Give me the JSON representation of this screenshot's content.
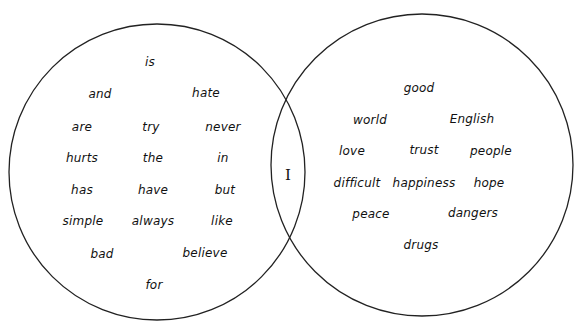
{
  "diagram": {
    "type": "venn",
    "circles": [
      {
        "id": "left",
        "cx": 157,
        "cy": 172,
        "r": 148
      },
      {
        "id": "right",
        "cx": 422,
        "cy": 165,
        "r": 151
      }
    ],
    "intersection": {
      "label": "I",
      "x": 288,
      "y": 175
    }
  },
  "left_words": [
    {
      "text": "is",
      "x": 150,
      "y": 62
    },
    {
      "text": "and",
      "x": 100,
      "y": 94
    },
    {
      "text": "hate",
      "x": 206,
      "y": 93
    },
    {
      "text": "are",
      "x": 82,
      "y": 127
    },
    {
      "text": "try",
      "x": 151,
      "y": 127
    },
    {
      "text": "never",
      "x": 223,
      "y": 127
    },
    {
      "text": "hurts",
      "x": 82,
      "y": 158
    },
    {
      "text": "the",
      "x": 153,
      "y": 158
    },
    {
      "text": "in",
      "x": 223,
      "y": 158
    },
    {
      "text": "has",
      "x": 82,
      "y": 190
    },
    {
      "text": "have",
      "x": 153,
      "y": 190
    },
    {
      "text": "but",
      "x": 225,
      "y": 190
    },
    {
      "text": "simple",
      "x": 83,
      "y": 221
    },
    {
      "text": "always",
      "x": 153,
      "y": 221
    },
    {
      "text": "like",
      "x": 222,
      "y": 221
    },
    {
      "text": "bad",
      "x": 102,
      "y": 254
    },
    {
      "text": "believe",
      "x": 205,
      "y": 253
    },
    {
      "text": "for",
      "x": 154,
      "y": 285
    }
  ],
  "right_words": [
    {
      "text": "good",
      "x": 419,
      "y": 88
    },
    {
      "text": "world",
      "x": 370,
      "y": 120
    },
    {
      "text": "English",
      "x": 472,
      "y": 119
    },
    {
      "text": "love",
      "x": 352,
      "y": 151
    },
    {
      "text": "trust",
      "x": 424,
      "y": 150
    },
    {
      "text": "people",
      "x": 491,
      "y": 151
    },
    {
      "text": "difficult",
      "x": 357,
      "y": 183
    },
    {
      "text": "happiness",
      "x": 424,
      "y": 183
    },
    {
      "text": "hope",
      "x": 489,
      "y": 183
    },
    {
      "text": "peace",
      "x": 371,
      "y": 214
    },
    {
      "text": "dangers",
      "x": 473,
      "y": 213
    },
    {
      "text": "drugs",
      "x": 421,
      "y": 245
    }
  ]
}
